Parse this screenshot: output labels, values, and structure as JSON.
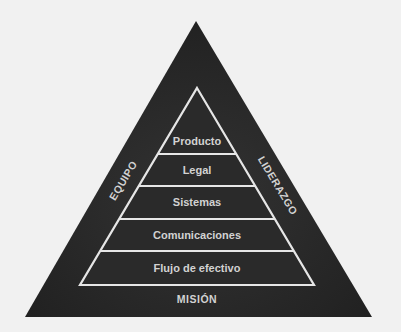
{
  "diagram": {
    "type": "nested-triangle-pyramid",
    "colors": {
      "background": "#f1f1f1",
      "outer_triangle": "#262626",
      "inner_triangle": "#2b2b2b",
      "lines": "#e6e6e6",
      "text": "#d2d2d2"
    },
    "outer_triangle": {
      "left_label": "EQUIPO",
      "right_label": "LIDERAZGO",
      "bottom_label": "MISIÓN"
    },
    "pyramid_levels": [
      {
        "label": "Producto"
      },
      {
        "label": "Legal"
      },
      {
        "label": "Sistemas"
      },
      {
        "label": "Comunicaciones"
      },
      {
        "label": "Flujo de efectivo"
      }
    ]
  }
}
